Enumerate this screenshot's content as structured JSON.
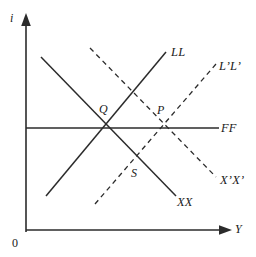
{
  "figure": {
    "type": "economics-line-diagram",
    "background_color": "#ffffff",
    "line_color": "#2b2b2b",
    "axes": {
      "y_axis_label": "i",
      "x_axis_label": "Y",
      "origin_label": "0"
    },
    "curves": [
      {
        "name": "LL",
        "label": "LL",
        "style": "solid",
        "slope": "upward",
        "x1": 46,
        "y1": 196,
        "x2": 166,
        "y2": 52
      },
      {
        "name": "L'L'",
        "label": "L’L’",
        "style": "dashed",
        "slope": "upward",
        "x1": 95,
        "y1": 204,
        "x2": 216,
        "y2": 64
      },
      {
        "name": "XX",
        "label": "XX",
        "style": "solid",
        "slope": "downward",
        "x1": 41,
        "y1": 57,
        "x2": 176,
        "y2": 196
      },
      {
        "name": "X'X'",
        "label": "X’X’",
        "style": "dashed",
        "slope": "downward",
        "x1": 90,
        "y1": 48,
        "x2": 216,
        "y2": 177
      },
      {
        "name": "FF",
        "label": "FF",
        "style": "solid",
        "slope": "horizontal",
        "x1": 26,
        "y1": 128,
        "x2": 219,
        "y2": 128
      }
    ],
    "points": [
      {
        "name": "Q",
        "label": "Q",
        "x": 103,
        "y": 128,
        "description": "intersection of LL, XX and FF"
      },
      {
        "name": "P",
        "label": "P",
        "x": 161,
        "y": 128,
        "description": "intersection of L’L’, X’X’ and FF"
      },
      {
        "name": "S",
        "label": "S",
        "x": 135,
        "y": 160,
        "description": "intersection of XX and L’L’"
      }
    ],
    "labels": {
      "ll": "LL",
      "l_prime_l_prime": "L’L’",
      "xx": "XX",
      "x_prime_x_prime": "X’X’",
      "ff": "FF",
      "q": "Q",
      "p": "P",
      "s": "S",
      "i": "i",
      "y": "Y",
      "origin": "0"
    }
  }
}
